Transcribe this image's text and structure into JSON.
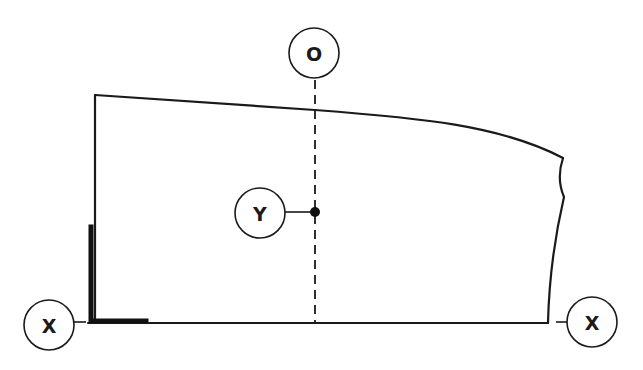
{
  "diagram": {
    "type": "technical-layout-sketch",
    "colors": {
      "line": "#1a1a1a",
      "background": "#ffffff"
    },
    "callouts": {
      "top": {
        "label": "O",
        "description": "vertical center/reference line marker"
      },
      "point": {
        "label": "Y",
        "description": "point marked on the reference line"
      },
      "left": {
        "label": "X",
        "description": "baseline end marker (left)"
      },
      "right": {
        "label": "X",
        "description": "baseline end marker (right)"
      }
    },
    "elements": [
      "panel outline with sloped/curved top edge",
      "wavy right edge",
      "straight baseline",
      "dashed vertical reference line",
      "thick L-shaped corner mark at lower-left"
    ]
  }
}
